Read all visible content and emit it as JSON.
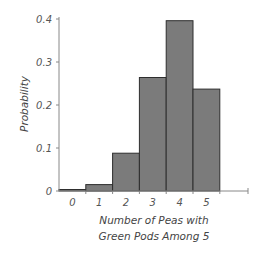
{
  "chart_data": {
    "type": "bar",
    "title": "",
    "xlabel": "Number of Peas with Green Pods Among 5",
    "xlabel_lines": [
      "Number of Peas with",
      "Green Pods Among 5"
    ],
    "ylabel": "Probability",
    "categories": [
      "0",
      "1",
      "2",
      "3",
      "4",
      "5"
    ],
    "values": [
      0.001,
      0.015,
      0.088,
      0.264,
      0.396,
      0.237
    ],
    "ylim": [
      0,
      0.4
    ],
    "yticks": [
      "0",
      "0.1",
      "0.2",
      "0.3",
      "0.4"
    ],
    "ytick_values": [
      0,
      0.1,
      0.2,
      0.3,
      0.4
    ],
    "grid": false,
    "legend": null,
    "bar_color": "#7b7b7b",
    "bar_edge_color": "#2e2e2e"
  }
}
